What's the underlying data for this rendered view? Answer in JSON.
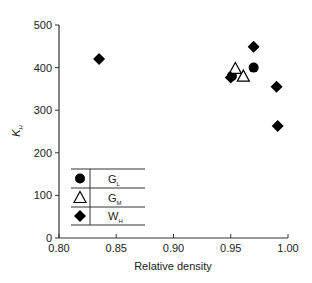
{
  "chart_data": {
    "type": "scatter",
    "title": "",
    "xlabel": "Relative density",
    "ylabel": "K",
    "ylabel_sub": "H",
    "xlim": [
      0.8,
      1.0
    ],
    "ylim": [
      0,
      500
    ],
    "x_ticks": [
      "0.80",
      "0.85",
      "0.90",
      "0.95",
      "1.00"
    ],
    "x_tick_values": [
      0.8,
      0.85,
      0.9,
      0.95,
      1.0
    ],
    "y_ticks": [
      "0",
      "100",
      "200",
      "300",
      "400",
      "500"
    ],
    "y_tick_values": [
      0,
      100,
      200,
      300,
      400,
      500
    ],
    "grid": false,
    "legend_position": "lower-left (inside plot, tabular)",
    "series": [
      {
        "name": "G_L",
        "label_main": "G",
        "label_sub": "L",
        "marker": "filled-circle",
        "points": [
          {
            "x": 0.951,
            "y": 380
          },
          {
            "x": 0.97,
            "y": 400
          }
        ]
      },
      {
        "name": "G_M",
        "label_main": "G",
        "label_sub": "M",
        "marker": "open-triangle",
        "points": [
          {
            "x": 0.954,
            "y": 398
          },
          {
            "x": 0.961,
            "y": 380
          }
        ]
      },
      {
        "name": "W_H",
        "label_main": "W",
        "label_sub": "H",
        "marker": "filled-diamond",
        "points": [
          {
            "x": 0.835,
            "y": 420
          },
          {
            "x": 0.95,
            "y": 377
          },
          {
            "x": 0.97,
            "y": 449
          },
          {
            "x": 0.99,
            "y": 355
          },
          {
            "x": 0.991,
            "y": 263
          }
        ]
      }
    ]
  },
  "colors": {
    "axis": "#333333",
    "marker": "#000000",
    "text": "#222222",
    "background": "#ffffff"
  }
}
